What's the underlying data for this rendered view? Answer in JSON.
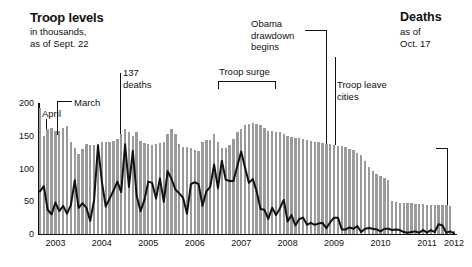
{
  "title_block": {
    "title": "Troop levels",
    "subtitle": "in thousands,\nas of Sept. 22"
  },
  "deaths_block": {
    "title": "Deaths",
    "subtitle": "as of\nOct. 17"
  },
  "annotations": [
    {
      "name": "march",
      "label": "March"
    },
    {
      "name": "april",
      "label": "April"
    },
    {
      "name": "137-deaths",
      "label": "137\ndeaths"
    },
    {
      "name": "troop-surge",
      "label": "Troop surge"
    },
    {
      "name": "obama-drawdown",
      "label": "Obama\ndrawdown\nbegins"
    },
    {
      "name": "troop-leave-cities",
      "label": "Troop leave\ncities"
    }
  ],
  "colors": {
    "bar": "#9a9a9a",
    "line": "#111111",
    "axis": "#111111",
    "background": "#ffffff"
  },
  "chart_data": {
    "type": "bar",
    "title": "Troop levels",
    "subtitle": "in thousands, as of Sept. 22",
    "xlabel": "",
    "ylabel": "in thousands",
    "ylim": [
      0,
      200
    ],
    "yticks": [
      0,
      50,
      100,
      150,
      200
    ],
    "xticks": [
      "2003",
      "2004",
      "2005",
      "2006",
      "2007",
      "2008",
      "2009",
      "2010",
      "2011",
      "2012"
    ],
    "grid": false,
    "legend": "none",
    "x_start": "2003-03",
    "x_end": "2012-01",
    "series": [
      {
        "name": "Troop levels",
        "type": "bar",
        "unit": "thousands",
        "color": "#9a9a9a",
        "values": [
          192,
          150,
          161,
          162,
          158,
          157,
          162,
          165,
          141,
          132,
          122,
          130,
          138,
          136,
          136,
          138,
          140,
          141,
          141,
          142,
          145,
          152,
          160,
          156,
          150,
          155,
          142,
          139,
          138,
          136,
          138,
          139,
          141,
          152,
          160,
          152,
          138,
          133,
          133,
          132,
          128,
          127,
          140,
          144,
          144,
          152,
          140,
          132,
          132,
          136,
          145,
          155,
          160,
          166,
          168,
          170,
          168,
          166,
          162,
          158,
          157,
          156,
          155,
          153,
          150,
          148,
          147,
          146,
          145,
          144,
          142,
          140,
          140,
          139,
          138,
          137,
          136,
          135,
          134,
          133,
          130,
          128,
          124,
          120,
          112,
          103,
          96,
          92,
          88,
          85,
          82,
          50,
          49,
          48,
          47,
          47,
          47,
          46,
          46,
          46,
          45,
          45,
          45,
          45,
          44,
          44,
          43,
          4
        ]
      },
      {
        "name": "U.S. military deaths",
        "type": "line",
        "unit": "deaths per month",
        "color": "#111111",
        "values": [
          65,
          73,
          37,
          30,
          48,
          35,
          43,
          31,
          44,
          82,
          40,
          47,
          40,
          20,
          52,
          135,
          80,
          42,
          54,
          66,
          80,
          64,
          137,
          72,
          127,
          58,
          35,
          52,
          80,
          78,
          54,
          85,
          49,
          96,
          84,
          68,
          62,
          55,
          31,
          76,
          79,
          76,
          43,
          65,
          72,
          106,
          70,
          112,
          83,
          81,
          81,
          104,
          126,
          101,
          78,
          84,
          65,
          38,
          37,
          23,
          40,
          29,
          39,
          52,
          19,
          29,
          13,
          23,
          25,
          14,
          17,
          14,
          16,
          17,
          9,
          18,
          25,
          25,
          7,
          7,
          10,
          8,
          12,
          3,
          8,
          9,
          8,
          7,
          4,
          8,
          8,
          6,
          7,
          6,
          3,
          2,
          3,
          4,
          2,
          6,
          2,
          6,
          3,
          15,
          13,
          2,
          4,
          1
        ]
      }
    ]
  }
}
